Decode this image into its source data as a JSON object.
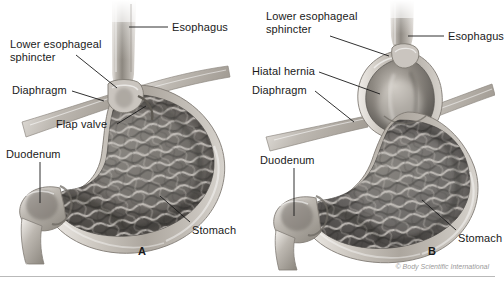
{
  "figure": {
    "copyright": "© Body Scientific International",
    "panels": [
      {
        "id": "A",
        "letter": "A",
        "name": "normal-anatomy",
        "labels": [
          {
            "name": "esophagus",
            "text": "Esophagus"
          },
          {
            "name": "lower-esophageal-sphincter",
            "text": "Lower esophageal\nsphincter"
          },
          {
            "name": "diaphragm",
            "text": "Diaphragm"
          },
          {
            "name": "flap-valve",
            "text": "Flap valve"
          },
          {
            "name": "duodenum",
            "text": "Duodenum"
          },
          {
            "name": "stomach",
            "text": "Stomach"
          }
        ]
      },
      {
        "id": "B",
        "letter": "B",
        "name": "hiatal-hernia-anatomy",
        "labels": [
          {
            "name": "lower-esophageal-sphincter",
            "text": "Lower esophageal\nsphincter"
          },
          {
            "name": "esophagus",
            "text": "Esophagus"
          },
          {
            "name": "hiatal-hernia",
            "text": "Hiatal hernia"
          },
          {
            "name": "diaphragm",
            "text": "Diaphragm"
          },
          {
            "name": "duodenum",
            "text": "Duodenum"
          },
          {
            "name": "stomach",
            "text": "Stomach"
          }
        ]
      }
    ],
    "colors": {
      "background": "#ffffff",
      "label_text": "#1a1a1a",
      "leader_line": "#1a1a1a",
      "copyright_text": "#9a9a9a",
      "baseline_rule": "#b9b9b9",
      "tissue_light": "#d8d4cf",
      "tissue_mid": "#9c9890",
      "tissue_dark": "#585550",
      "mucosa_dark": "#4a4744"
    }
  }
}
